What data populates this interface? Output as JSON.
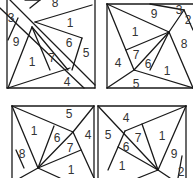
{
  "puzzle": {
    "stroke_color": "#1a1a1a",
    "label_color": "#333333",
    "background": "#ffffff",
    "panels": [
      {
        "id": "top-left",
        "lines": [
          [
            7,
            0,
            7,
            88
          ],
          [
            7,
            88,
            95,
            88
          ],
          [
            95,
            88,
            95,
            0
          ],
          [
            10,
            0,
            95,
            85
          ],
          [
            0,
            8,
            84,
            88
          ],
          [
            25,
            0,
            40,
            0
          ],
          [
            40,
            0,
            30,
            8
          ],
          [
            18,
            18,
            8,
            40
          ],
          [
            35,
            22,
            92,
            5
          ],
          [
            35,
            22,
            82,
            38
          ],
          [
            82,
            38,
            72,
            70
          ],
          [
            32,
            27,
            8,
            88
          ],
          [
            32,
            27,
            50,
            70
          ],
          [
            32,
            27,
            68,
            70
          ],
          [
            8,
            88,
            70,
            68
          ]
        ],
        "labels": [
          {
            "text": "8",
            "x": 55,
            "y": 3
          },
          {
            "text": "3",
            "x": 11,
            "y": 18
          },
          {
            "text": "1",
            "x": 70,
            "y": 23
          },
          {
            "text": "9",
            "x": 16,
            "y": 42
          },
          {
            "text": "6",
            "x": 69,
            "y": 43
          },
          {
            "text": "5",
            "x": 86,
            "y": 53
          },
          {
            "text": "1",
            "x": 32,
            "y": 62
          },
          {
            "text": "7",
            "x": 52,
            "y": 58
          },
          {
            "text": "4",
            "x": 67,
            "y": 82
          }
        ]
      },
      {
        "id": "top-right",
        "lines": [
          [
            107,
            4,
            193,
            4
          ],
          [
            107,
            4,
            107,
            88
          ],
          [
            107,
            88,
            193,
            88
          ],
          [
            107,
            4,
            169,
            32
          ],
          [
            169,
            32,
            193,
            88
          ],
          [
            150,
            4,
            184,
            10
          ],
          [
            184,
            10,
            193,
            30
          ],
          [
            169,
            32,
            184,
            10
          ],
          [
            107,
            4,
            134,
            70
          ],
          [
            134,
            70,
            169,
            32
          ],
          [
            126,
            50,
            169,
            32
          ],
          [
            150,
            70,
            169,
            32
          ],
          [
            134,
            70,
            107,
            88
          ],
          [
            134,
            70,
            193,
            88
          ]
        ],
        "labels": [
          {
            "text": "9",
            "x": 154,
            "y": 14
          },
          {
            "text": "3",
            "x": 179,
            "y": 10
          },
          {
            "text": "2",
            "x": 188,
            "y": 20
          },
          {
            "text": "1",
            "x": 135,
            "y": 32
          },
          {
            "text": "8",
            "x": 184,
            "y": 44
          },
          {
            "text": "7",
            "x": 136,
            "y": 55
          },
          {
            "text": "6",
            "x": 148,
            "y": 64
          },
          {
            "text": "4",
            "x": 118,
            "y": 63
          },
          {
            "text": "1",
            "x": 167,
            "y": 71
          },
          {
            "text": "5",
            "x": 136,
            "y": 84
          }
        ]
      },
      {
        "id": "bottom-left",
        "lines": [
          [
            12,
            106,
            94,
            106
          ],
          [
            12,
            106,
            12,
            178
          ],
          [
            94,
            106,
            94,
            178
          ],
          [
            12,
            106,
            73,
            132
          ],
          [
            73,
            132,
            94,
            106
          ],
          [
            12,
            106,
            38,
            168
          ],
          [
            38,
            168,
            73,
            132
          ],
          [
            54,
            126,
            38,
            168
          ],
          [
            38,
            168,
            81,
            150
          ],
          [
            73,
            132,
            94,
            178
          ],
          [
            16,
            150,
            24,
            168
          ],
          [
            38,
            168,
            60,
            178
          ],
          [
            38,
            168,
            20,
            178
          ]
        ],
        "labels": [
          {
            "text": "5",
            "x": 69,
            "y": 114
          },
          {
            "text": "1",
            "x": 34,
            "y": 131
          },
          {
            "text": "6",
            "x": 57,
            "y": 138
          },
          {
            "text": "4",
            "x": 88,
            "y": 135
          },
          {
            "text": "7",
            "x": 70,
            "y": 148
          },
          {
            "text": "8",
            "x": 22,
            "y": 154
          },
          {
            "text": "1",
            "x": 71,
            "y": 170
          }
        ]
      },
      {
        "id": "bottom-right",
        "lines": [
          [
            98,
            106,
            186,
            106
          ],
          [
            98,
            106,
            98,
            178
          ],
          [
            186,
            106,
            186,
            178
          ],
          [
            98,
            106,
            158,
            170
          ],
          [
            158,
            170,
            186,
            106
          ],
          [
            125,
            131,
            186,
            106
          ],
          [
            125,
            131,
            108,
            170
          ],
          [
            142,
            124,
            158,
            170
          ],
          [
            118,
            147,
            158,
            170
          ],
          [
            158,
            170,
            138,
            178
          ],
          [
            158,
            170,
            170,
            178
          ],
          [
            182,
            156,
            178,
            178
          ]
        ],
        "labels": [
          {
            "text": "4",
            "x": 126,
            "y": 118
          },
          {
            "text": "5",
            "x": 108,
            "y": 135
          },
          {
            "text": "7",
            "x": 138,
            "y": 138
          },
          {
            "text": "1",
            "x": 162,
            "y": 136
          },
          {
            "text": "6",
            "x": 126,
            "y": 147
          },
          {
            "text": "9",
            "x": 174,
            "y": 154
          },
          {
            "text": "1",
            "x": 122,
            "y": 166
          },
          {
            "text": "2",
            "x": 181,
            "y": 172
          }
        ]
      }
    ]
  }
}
